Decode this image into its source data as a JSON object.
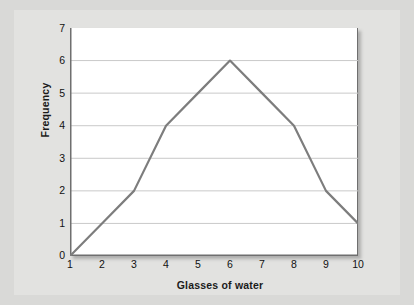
{
  "chart_data": {
    "type": "line",
    "title": "",
    "subtitle": "",
    "xlabel": "Glasses of water",
    "ylabel": "Frequency",
    "x": [
      1,
      2,
      3,
      4,
      5,
      6,
      7,
      8,
      9,
      10
    ],
    "values": [
      0,
      1,
      2,
      4,
      5,
      6,
      5,
      4,
      2,
      1
    ],
    "series": [
      {
        "name": "Frequency",
        "values": [
          0,
          1,
          2,
          4,
          5,
          6,
          5,
          4,
          2,
          1
        ]
      }
    ],
    "xtick_labels": [
      "1",
      "2",
      "3",
      "4",
      "5",
      "6",
      "7",
      "8",
      "9",
      "10"
    ],
    "ytick_labels": [
      "0",
      "1",
      "2",
      "3",
      "4",
      "5",
      "6",
      "7"
    ],
    "xlim": [
      1,
      10
    ],
    "ylim": [
      0,
      7
    ],
    "grid": "horizontal",
    "legend": "none",
    "annotations": [],
    "colors": {
      "line": "#7d7d7d",
      "gridline": "#c9c9c9",
      "axis": "#6f6f6f",
      "panel_background": "#ffffff",
      "page_background": "#d9d9d7",
      "text": "#111111"
    }
  }
}
